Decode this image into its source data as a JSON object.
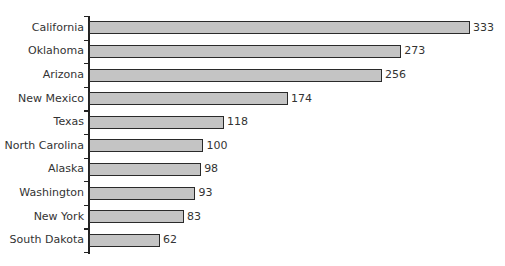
{
  "chart_data": {
    "type": "bar",
    "orientation": "horizontal",
    "title": "",
    "xlabel": "",
    "ylabel": "",
    "categories": [
      "California",
      "Oklahoma",
      "Arizona",
      "New Mexico",
      "Texas",
      "North Carolina",
      "Alaska",
      "Washington",
      "New York",
      "South Dakota"
    ],
    "values": [
      333,
      273,
      256,
      174,
      118,
      100,
      98,
      93,
      83,
      62
    ],
    "data_labels": [
      "333",
      "273",
      "256",
      "174",
      "118",
      "100",
      "98",
      "93",
      "83",
      "62"
    ],
    "xlim": [
      0,
      333
    ],
    "grid": false,
    "legend": null,
    "bar_color": "#c4c4c4",
    "bar_edge_color": "#2a2a2a"
  }
}
